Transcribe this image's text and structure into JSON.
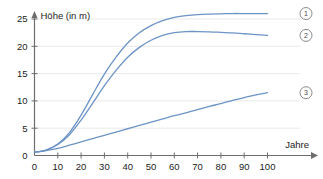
{
  "chart_data": {
    "type": "line",
    "title": "",
    "xlabel": "Jahre",
    "ylabel": "Höhe (in m)",
    "xlim": [
      0,
      110
    ],
    "ylim": [
      0,
      27
    ],
    "xticks": [
      0,
      10,
      20,
      30,
      40,
      50,
      60,
      70,
      80,
      90,
      100
    ],
    "yticks": [
      0,
      5,
      10,
      15,
      20,
      25
    ],
    "grid": true,
    "legend_position": "right-of-curve-ends",
    "line_color": "#6c94c6",
    "x": [
      0,
      5,
      10,
      15,
      20,
      25,
      30,
      35,
      40,
      45,
      50,
      55,
      60,
      65,
      70,
      75,
      80,
      85,
      90,
      95,
      100
    ],
    "series": [
      {
        "name": "1",
        "label": "①",
        "values": [
          0.6,
          1.0,
          2.1,
          4.2,
          7.4,
          11.2,
          14.9,
          18.0,
          20.6,
          22.5,
          23.8,
          24.7,
          25.3,
          25.6,
          25.8,
          25.9,
          25.95,
          26.0,
          26.0,
          26.0,
          26.0
        ]
      },
      {
        "name": "2",
        "label": "②",
        "values": [
          0.6,
          1.0,
          2.0,
          3.8,
          6.5,
          9.6,
          12.8,
          15.6,
          18.0,
          19.8,
          21.1,
          22.0,
          22.5,
          22.7,
          22.7,
          22.65,
          22.55,
          22.45,
          22.3,
          22.15,
          22.0
        ]
      },
      {
        "name": "3",
        "label": "③",
        "values": [
          0.6,
          0.9,
          1.3,
          1.9,
          2.5,
          3.1,
          3.7,
          4.3,
          4.9,
          5.5,
          6.1,
          6.7,
          7.3,
          7.8,
          8.4,
          9.0,
          9.5,
          10.1,
          10.6,
          11.1,
          11.5
        ]
      }
    ],
    "legend_markers": [
      {
        "label": "①",
        "number": "1",
        "y_value": 26.0
      },
      {
        "label": "②",
        "number": "2",
        "y_value": 22.0
      },
      {
        "label": "③",
        "number": "3",
        "y_value": 11.5
      }
    ]
  },
  "axis": {
    "y_label_text": "Höhe (in m)",
    "x_label_text": "Jahre",
    "x_tick_labels": [
      "0",
      "10",
      "20",
      "30",
      "40",
      "50",
      "60",
      "70",
      "80",
      "90",
      "100"
    ],
    "y_tick_labels": [
      "0",
      "5",
      "10",
      "15",
      "20",
      "25"
    ]
  },
  "top_cropped_text": ""
}
